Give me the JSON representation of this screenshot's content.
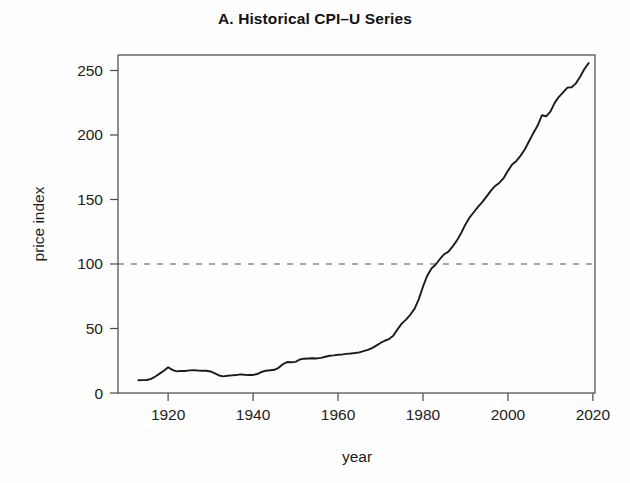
{
  "chart_data": {
    "type": "line",
    "title": "A. Historical CPI–U Series",
    "xlabel": "year",
    "ylabel": "price index",
    "xlim": [
      1908.2,
      2020.5
    ],
    "ylim": [
      0,
      262
    ],
    "grid": false,
    "legend": null,
    "xticks": [
      1920,
      1940,
      1960,
      1980,
      2000,
      2020
    ],
    "xtick_labels": [
      "1920",
      "1940",
      "1960",
      "1980",
      "2000",
      "2020"
    ],
    "yticks": [
      0,
      50,
      100,
      150,
      200,
      250
    ],
    "ytick_labels": [
      "0",
      "50",
      "100",
      "150",
      "200",
      "250"
    ],
    "reference_lines": [
      {
        "name": "base-period-100",
        "orientation": "horizontal",
        "value": 100,
        "style": "dashed",
        "color": "#8c8c8c"
      }
    ],
    "series": [
      {
        "name": "CPI-U",
        "color": "#1b1b1b",
        "x": [
          1913,
          1914,
          1915,
          1916,
          1917,
          1918,
          1919,
          1920,
          1921,
          1922,
          1923,
          1924,
          1925,
          1926,
          1927,
          1928,
          1929,
          1930,
          1931,
          1932,
          1933,
          1934,
          1935,
          1936,
          1937,
          1938,
          1939,
          1940,
          1941,
          1942,
          1943,
          1944,
          1945,
          1946,
          1947,
          1948,
          1949,
          1950,
          1951,
          1952,
          1953,
          1954,
          1955,
          1956,
          1957,
          1958,
          1959,
          1960,
          1961,
          1962,
          1963,
          1964,
          1965,
          1966,
          1967,
          1968,
          1969,
          1970,
          1971,
          1972,
          1973,
          1974,
          1975,
          1976,
          1977,
          1978,
          1979,
          1980,
          1981,
          1982,
          1983,
          1984,
          1985,
          1986,
          1987,
          1988,
          1989,
          1990,
          1991,
          1992,
          1993,
          1994,
          1995,
          1996,
          1997,
          1998,
          1999,
          2000,
          2001,
          2002,
          2003,
          2004,
          2005,
          2006,
          2007,
          2008,
          2009,
          2010,
          2011,
          2012,
          2013,
          2014,
          2015,
          2016,
          2017,
          2018,
          2019
        ],
        "values": [
          9.9,
          10.0,
          10.1,
          10.9,
          12.8,
          15.0,
          17.3,
          20.0,
          17.9,
          16.8,
          17.1,
          17.1,
          17.5,
          17.7,
          17.4,
          17.2,
          17.2,
          16.7,
          15.2,
          13.6,
          12.9,
          13.4,
          13.7,
          13.9,
          14.4,
          14.1,
          13.9,
          14.0,
          14.7,
          16.3,
          17.3,
          17.6,
          18.0,
          19.5,
          22.3,
          24.0,
          23.8,
          24.1,
          26.0,
          26.6,
          26.8,
          26.9,
          26.8,
          27.2,
          28.1,
          28.9,
          29.2,
          29.6,
          29.9,
          30.3,
          30.6,
          31.0,
          31.5,
          32.5,
          33.4,
          34.8,
          36.7,
          38.8,
          40.5,
          41.8,
          44.4,
          49.3,
          53.8,
          56.9,
          60.6,
          65.2,
          72.6,
          82.4,
          90.9,
          96.5,
          99.6,
          103.9,
          107.6,
          109.6,
          113.6,
          118.3,
          124.0,
          130.7,
          136.2,
          140.3,
          144.5,
          148.2,
          152.4,
          156.9,
          160.5,
          163.0,
          166.6,
          172.2,
          177.1,
          179.9,
          184.0,
          188.9,
          195.3,
          201.6,
          207.3,
          215.3,
          214.5,
          218.1,
          224.9,
          229.6,
          233.0,
          236.7,
          237.0,
          240.0,
          245.1,
          251.1,
          255.7
        ]
      }
    ]
  },
  "figure": {
    "background": "#fefefe",
    "frame_color": "#4d4d4d",
    "text_color": "#1a1a1a"
  }
}
